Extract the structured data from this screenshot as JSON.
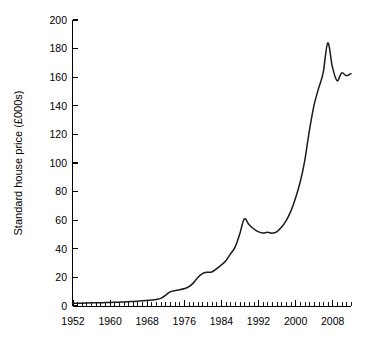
{
  "chart_data": {
    "type": "line",
    "title": "",
    "subtitle": "",
    "xlabel": "",
    "ylabel": "Standard house price (£000s)",
    "xlim": [
      1952,
      2012
    ],
    "ylim": [
      0,
      200
    ],
    "grid": false,
    "legend": null,
    "legend_position": "none",
    "y_ticks": [
      0,
      20,
      40,
      60,
      80,
      100,
      120,
      140,
      160,
      180,
      200
    ],
    "y_tick_labels": [
      "0",
      "20",
      "40",
      "60",
      "80",
      "100",
      "120",
      "140",
      "160",
      "180",
      "200"
    ],
    "x_ticks": [
      1952,
      1960,
      1968,
      1976,
      1984,
      1992,
      2000,
      2008
    ],
    "x_tick_labels": [
      "1952",
      "1960",
      "1968",
      "1976",
      "1984",
      "1992",
      "2000",
      "2008"
    ],
    "x_minor_tick_interval": 1,
    "line_color": "#1a1a1a",
    "series": [
      {
        "name": "Standard house price",
        "x": [
          1952,
          1953,
          1954,
          1955,
          1956,
          1957,
          1958,
          1959,
          1960,
          1961,
          1962,
          1963,
          1964,
          1965,
          1966,
          1967,
          1968,
          1969,
          1970,
          1971,
          1972,
          1973,
          1974,
          1975,
          1976,
          1977,
          1978,
          1979,
          1980,
          1981,
          1982,
          1983,
          1984,
          1985,
          1986,
          1987,
          1988,
          1989,
          1990,
          1991,
          1992,
          1993,
          1994,
          1995,
          1996,
          1997,
          1998,
          1999,
          2000,
          2001,
          2002,
          2003,
          2004,
          2005,
          2006,
          2007,
          2008,
          2009,
          2010,
          2011,
          2012
        ],
        "values": [
          1.9,
          1.9,
          2.0,
          2.1,
          2.2,
          2.2,
          2.3,
          2.4,
          2.5,
          2.6,
          2.7,
          2.8,
          3.0,
          3.2,
          3.4,
          3.6,
          3.9,
          4.2,
          4.6,
          5.3,
          7.4,
          9.9,
          10.7,
          11.3,
          12.0,
          13.3,
          16.0,
          20.0,
          22.7,
          23.6,
          23.8,
          26.0,
          28.5,
          31.5,
          36.3,
          41.0,
          50.0,
          60.8,
          57.0,
          54.0,
          52.0,
          51.0,
          51.5,
          50.9,
          51.8,
          55.0,
          59.6,
          66.0,
          75.0,
          86.0,
          101.0,
          122.0,
          140.0,
          152.0,
          163.0,
          184.0,
          167.0,
          157.5,
          163.0,
          161.0,
          162.5
        ]
      }
    ],
    "annotations": []
  },
  "figure": {
    "background_color": "#ffffff",
    "axis_color": "#000000"
  }
}
